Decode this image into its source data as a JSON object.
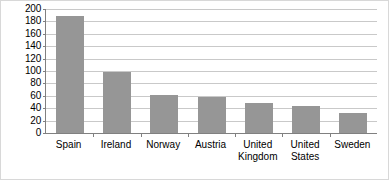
{
  "chart_data": {
    "type": "bar",
    "title": "",
    "subtitle": "",
    "xlabel": "",
    "ylabel": "",
    "categories": [
      "Spain",
      "Ireland",
      "Norway",
      "Austria",
      "United Kingdom",
      "United States",
      "Sweden"
    ],
    "category_lines": [
      [
        "Spain"
      ],
      [
        "Ireland"
      ],
      [
        "Norway"
      ],
      [
        "Austria"
      ],
      [
        "United",
        "Kingdom"
      ],
      [
        "United",
        "States"
      ],
      [
        "Sweden"
      ]
    ],
    "values": [
      188,
      98,
      62,
      58,
      48,
      44,
      32
    ],
    "ylim": [
      0,
      200
    ],
    "yticks": [
      0,
      20,
      40,
      60,
      80,
      100,
      120,
      140,
      160,
      180,
      200
    ],
    "ytick_labels": [
      "0",
      "20",
      "40",
      "60",
      "80",
      "100",
      "120",
      "140",
      "160",
      "180",
      "200"
    ],
    "grid": true,
    "grid_axis": "y",
    "legend": false,
    "legend_position": "none",
    "series": [
      {
        "name": "",
        "values": [
          188,
          98,
          62,
          58,
          48,
          44,
          32
        ]
      }
    ],
    "colors": {
      "bar": "#969696",
      "gridline": "#c9c9c9",
      "axis": "#808080",
      "border": "#d8d8d8",
      "background": "#ffffff",
      "text": "#000000"
    }
  }
}
